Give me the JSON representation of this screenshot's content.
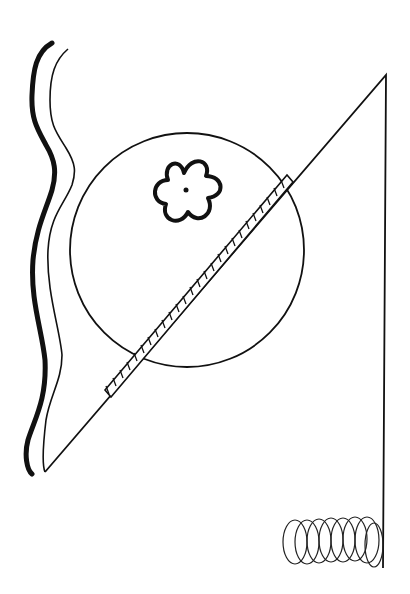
{
  "image": {
    "description": "Black-and-white abstract line drawing: wavy double line on left, large circle with a six-petal flower, a hatched diagonal bar, a tall right triangle, and a coil spring at bottom right.",
    "background_color": "#ffffff",
    "ink_color": "#111111"
  },
  "elements": [
    {
      "name": "wavy-double-line",
      "label": "Wavy double line"
    },
    {
      "name": "circle",
      "label": "Large circle"
    },
    {
      "name": "flower",
      "label": "Six-petal flower"
    },
    {
      "name": "hatched-bar",
      "label": "Hatched diagonal bar"
    },
    {
      "name": "triangle",
      "label": "Tall right triangle"
    },
    {
      "name": "coil-spring",
      "label": "Coil spring"
    }
  ]
}
